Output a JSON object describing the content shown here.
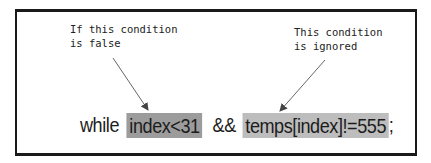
{
  "diagram": {
    "annotations": {
      "left": "If this condition\nis false",
      "right": "This condition\nis ignored"
    },
    "code": {
      "keyword": "while",
      "condition1": "index<31",
      "operator": "&&",
      "condition2": "temps[index]!=555",
      "terminator": ";"
    },
    "colors": {
      "border": "#1a1a1a",
      "highlight_condition1": "#9c9c9c",
      "highlight_condition2": "#bdbdbd",
      "arrow": "#555555"
    }
  }
}
